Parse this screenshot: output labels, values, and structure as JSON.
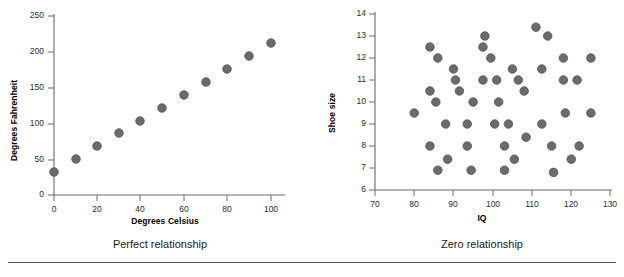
{
  "figure": {
    "footer_rule": "horizontal-rule"
  },
  "panels": [
    {
      "id": "perfect-relationship",
      "caption": "Perfect relationship",
      "xlabel": "Degrees Celsius",
      "ylabel": "Degrees Fahrenheit",
      "xticks": [
        "0",
        "20",
        "40",
        "60",
        "80",
        "100"
      ],
      "yticks": [
        "0",
        "50",
        "100",
        "150",
        "200",
        "250"
      ]
    },
    {
      "id": "zero-relationship",
      "caption": "Zero relationship",
      "xlabel": "IQ",
      "ylabel": "Shoe size",
      "xticks": [
        "70",
        "80",
        "90",
        "100",
        "110",
        "120",
        "130"
      ],
      "yticks": [
        "6",
        "7",
        "8",
        "9",
        "10",
        "11",
        "12",
        "13",
        "14"
      ]
    }
  ],
  "chart_data": [
    {
      "type": "scatter",
      "title": "Perfect relationship",
      "xlabel": "Degrees Celsius",
      "ylabel": "Degrees Fahrenheit",
      "xlim": [
        0,
        110
      ],
      "ylim": [
        0,
        250
      ],
      "xticks": [
        0,
        20,
        40,
        60,
        80,
        100
      ],
      "yticks": [
        0,
        50,
        100,
        150,
        200,
        250
      ],
      "grid": false,
      "legend": "none",
      "marker_color": "#6b6b6b",
      "x": [
        0,
        10,
        20,
        30,
        40,
        50,
        60,
        70,
        80,
        90,
        100
      ],
      "y": [
        32,
        50,
        68,
        86,
        104,
        122,
        140,
        158,
        176,
        194,
        212
      ]
    },
    {
      "type": "scatter",
      "title": "Zero relationship",
      "xlabel": "IQ",
      "ylabel": "Shoe size",
      "xlim": [
        70,
        130
      ],
      "ylim": [
        6,
        14
      ],
      "xticks": [
        70,
        80,
        90,
        100,
        110,
        120,
        130
      ],
      "yticks": [
        6,
        7,
        8,
        9,
        10,
        11,
        12,
        13,
        14
      ],
      "grid": false,
      "legend": "none",
      "marker_color": "#6b6b6b",
      "points": [
        [
          80.0,
          9.5
        ],
        [
          84.0,
          12.5
        ],
        [
          84.0,
          10.5
        ],
        [
          84.0,
          8.0
        ],
        [
          85.5,
          10.0
        ],
        [
          86.0,
          12.0
        ],
        [
          86.0,
          6.9
        ],
        [
          88.0,
          9.0
        ],
        [
          88.5,
          7.4
        ],
        [
          90.0,
          11.5
        ],
        [
          90.5,
          11.0
        ],
        [
          91.5,
          10.5
        ],
        [
          93.5,
          9.0
        ],
        [
          93.5,
          8.0
        ],
        [
          94.5,
          6.9
        ],
        [
          95.0,
          10.0
        ],
        [
          97.5,
          11.0
        ],
        [
          97.5,
          12.5
        ],
        [
          98.0,
          13.0
        ],
        [
          99.5,
          12.0
        ],
        [
          100.5,
          9.0
        ],
        [
          101.0,
          11.0
        ],
        [
          101.5,
          10.0
        ],
        [
          103.0,
          8.0
        ],
        [
          103.0,
          6.9
        ],
        [
          104.0,
          9.0
        ],
        [
          105.0,
          11.5
        ],
        [
          105.5,
          7.4
        ],
        [
          106.5,
          11.0
        ],
        [
          108.0,
          10.5
        ],
        [
          108.5,
          8.4
        ],
        [
          111.0,
          13.4
        ],
        [
          112.5,
          11.5
        ],
        [
          112.5,
          9.0
        ],
        [
          114.0,
          13.0
        ],
        [
          115.0,
          8.0
        ],
        [
          115.5,
          6.8
        ],
        [
          118.0,
          12.0
        ],
        [
          118.0,
          11.0
        ],
        [
          118.5,
          9.5
        ],
        [
          120.0,
          7.4
        ],
        [
          121.5,
          11.0
        ],
        [
          122.0,
          8.0
        ],
        [
          125.0,
          12.0
        ],
        [
          125.0,
          9.5
        ]
      ]
    }
  ]
}
